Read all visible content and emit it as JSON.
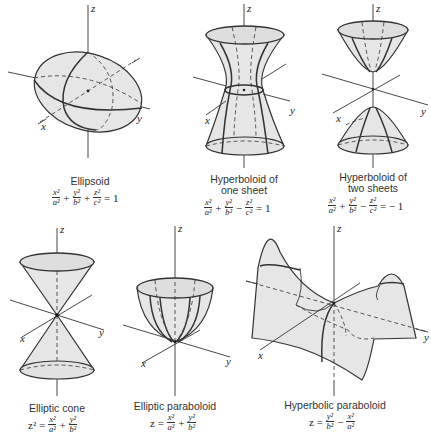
{
  "figure": {
    "surface_fill": "#e6e6e6",
    "line_color": "#333333",
    "panels": [
      {
        "id": "ellipsoid",
        "name": "Ellipsoid",
        "axes": {
          "x": "x",
          "y": "y",
          "z": "z"
        },
        "equation": {
          "lhs": [
            "x²/a²",
            "+",
            "y²/b²",
            "+",
            "z²/c²"
          ],
          "rhs": "1"
        },
        "terms": [
          {
            "num": "x²",
            "den": "a²"
          },
          {
            "num": "y²",
            "den": "b²"
          },
          {
            "num": "z²",
            "den": "c²"
          }
        ],
        "ops": [
          "+",
          "+",
          "= 1"
        ]
      },
      {
        "id": "hyperboloid-one-sheet",
        "name_line1": "Hyperboloid of",
        "name_line2": "one sheet",
        "axes": {
          "x": "x",
          "y": "y",
          "z": "z"
        },
        "terms": [
          {
            "num": "x²",
            "den": "a²"
          },
          {
            "num": "y²",
            "den": "b²"
          },
          {
            "num": "z²",
            "den": "c²"
          }
        ],
        "ops": [
          "+",
          "−",
          "= 1"
        ]
      },
      {
        "id": "hyperboloid-two-sheets",
        "name_line1": "Hyperboloid of",
        "name_line2": "two sheets",
        "axes": {
          "x": "x",
          "y": "y",
          "z": "z"
        },
        "terms": [
          {
            "num": "x²",
            "den": "a²"
          },
          {
            "num": "y²",
            "den": "b²"
          },
          {
            "num": "z²",
            "den": "c²"
          }
        ],
        "ops": [
          "+",
          "−",
          "= − 1"
        ]
      },
      {
        "id": "elliptic-cone",
        "name": "Elliptic cone",
        "axes": {
          "x": "x",
          "y": "y",
          "z": "z"
        },
        "lhs": "z² =",
        "terms": [
          {
            "num": "x²",
            "den": "a²"
          },
          {
            "num": "y²",
            "den": "b²"
          }
        ],
        "ops": [
          "+"
        ]
      },
      {
        "id": "elliptic-paraboloid",
        "name": "Elliptic paraboloid",
        "axes": {
          "x": "x",
          "y": "y",
          "z": "z"
        },
        "lhs": "z =",
        "terms": [
          {
            "num": "x²",
            "den": "a²"
          },
          {
            "num": "y²",
            "den": "b²"
          }
        ],
        "ops": [
          "+"
        ]
      },
      {
        "id": "hyperbolic-paraboloid",
        "name": "Hyperbolic paraboloid",
        "axes": {
          "x": "x",
          "y": "y",
          "z": "z"
        },
        "lhs": "z =",
        "terms": [
          {
            "num": "y²",
            "den": "b²"
          },
          {
            "num": "x²",
            "den": "a²"
          }
        ],
        "ops": [
          "−"
        ]
      }
    ]
  }
}
